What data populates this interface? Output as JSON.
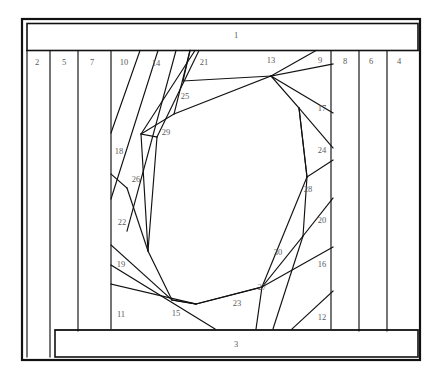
{
  "document": {
    "title": "Foundation Piecing Block Pattern",
    "kind": "quilt-block-diagram",
    "width": 443,
    "height": 379
  },
  "style": {
    "background_color": "#ffffff",
    "line_color": "#111111",
    "label_color": "#5b5b5b",
    "outer_border_width": 2.2,
    "seam_line_width": 1.15
  },
  "labels": [
    {
      "id": "1",
      "text": "1",
      "x": 236,
      "y": 36
    },
    {
      "id": "2",
      "text": "2",
      "x": 37,
      "y": 63
    },
    {
      "id": "5",
      "text": "5",
      "x": 64,
      "y": 63
    },
    {
      "id": "7",
      "text": "7",
      "x": 92,
      "y": 63
    },
    {
      "id": "10",
      "text": "10",
      "x": 124,
      "y": 63
    },
    {
      "id": "14",
      "text": "14",
      "x": 156,
      "y": 64
    },
    {
      "id": "21",
      "text": "21",
      "x": 204,
      "y": 63
    },
    {
      "id": "13",
      "text": "13",
      "x": 271,
      "y": 61
    },
    {
      "id": "9",
      "text": "9",
      "x": 320,
      "y": 61
    },
    {
      "id": "8",
      "text": "8",
      "x": 345,
      "y": 62
    },
    {
      "id": "6",
      "text": "6",
      "x": 371,
      "y": 62
    },
    {
      "id": "4",
      "text": "4",
      "x": 399,
      "y": 62
    },
    {
      "id": "25",
      "text": "25",
      "x": 185,
      "y": 97
    },
    {
      "id": "17",
      "text": "17",
      "x": 322,
      "y": 109
    },
    {
      "id": "29",
      "text": "29",
      "x": 166,
      "y": 133
    },
    {
      "id": "18",
      "text": "18",
      "x": 119,
      "y": 152
    },
    {
      "id": "24",
      "text": "24",
      "x": 322,
      "y": 151
    },
    {
      "id": "26",
      "text": "26",
      "x": 136,
      "y": 180
    },
    {
      "id": "28",
      "text": "28",
      "x": 308,
      "y": 190
    },
    {
      "id": "22",
      "text": "22",
      "x": 122,
      "y": 223
    },
    {
      "id": "20",
      "text": "20",
      "x": 322,
      "y": 221
    },
    {
      "id": "30",
      "text": "30",
      "x": 278,
      "y": 253
    },
    {
      "id": "19",
      "text": "19",
      "x": 121,
      "y": 265
    },
    {
      "id": "16",
      "text": "16",
      "x": 322,
      "y": 265
    },
    {
      "id": "27",
      "text": "27",
      "x": 262,
      "y": 288
    },
    {
      "id": "23",
      "text": "23",
      "x": 237,
      "y": 304
    },
    {
      "id": "11",
      "text": "11",
      "x": 121,
      "y": 315
    },
    {
      "id": "15",
      "text": "15",
      "x": 176,
      "y": 314
    },
    {
      "id": "12",
      "text": "12",
      "x": 322,
      "y": 318
    },
    {
      "id": "3",
      "text": "3",
      "x": 236,
      "y": 345
    }
  ],
  "geometry": {
    "outer_frame": {
      "x": 22,
      "y": 19,
      "width": 398,
      "height": 341
    },
    "top_band": {
      "x": 27,
      "y": 23,
      "width": 391,
      "height": 27,
      "label": "1"
    },
    "bottom_band": {
      "x": 55,
      "y": 331,
      "width": 363,
      "height": 26,
      "label": "3"
    },
    "center_panel": {
      "x": 111,
      "y": 51,
      "width": 220,
      "height": 277
    },
    "left_strips": [
      {
        "label": "2",
        "x1": 27,
        "x2": 50
      },
      {
        "label": "5",
        "x1": 50,
        "x2": 78
      },
      {
        "label": "7",
        "x1": 78,
        "x2": 111
      },
      {
        "label": "10",
        "x1": 111,
        "x2": 140
      }
    ],
    "right_strips": [
      {
        "label": "8",
        "x1": 331,
        "x2": 359
      },
      {
        "label": "6",
        "x1": 359,
        "x2": 387
      },
      {
        "label": "4",
        "x1": 387,
        "x2": 414
      }
    ],
    "center_opening": {
      "description": "Central octagonal opening formed by the numbered wedge pieces",
      "points": "174,114 201,92 271,76 299,108 307,176 303,235 262,287 195,304 146,264 127,188 141,134"
    },
    "seam_paths": [
      "M 111,51 L 111,328",
      "M 331,51 L 331,328",
      "M 27,51 L 27,357",
      "M 50,51 L 50,357",
      "M 78,51 L 78,331",
      "M 140,51 L 111,133",
      "M 156,51 L 111,197",
      "M 173,51 L 127,230",
      "M 196,51 L 141,134",
      "M 199,51 L 156,136",
      "M 186,51 L 174,114",
      "M 196,51 L 271,76",
      "M 271,76 L 174,114",
      "M 174,114 L 141,134",
      "M 141,134 L 156,136",
      "M 156,136 L 147,250",
      "M 127,188 L 141,134",
      "M 127,188 L 111,173",
      "M 127,188 L 147,250",
      "M 111,244 L 171,299",
      "M 111,265 L 213,328",
      "M 111,283 L 195,304",
      "M 171,299 L 195,304",
      "M 195,304 L 262,287",
      "M 262,287 L 303,235",
      "M 303,235 L 307,176",
      "M 307,176 L 299,108",
      "M 299,108 L 271,76",
      "M 271,76 L 331,113",
      "M 271,76 L 316,51",
      "M 271,76 L 331,65",
      "M 299,108 L 331,147",
      "M 307,176 L 331,161",
      "M 303,235 L 331,197",
      "M 262,287 L 331,247",
      "M 262,287 L 255,328",
      "M 303,235 L 272,328",
      "M 307,176 L 262,287",
      "M 331,290 L 291,328"
    ]
  }
}
